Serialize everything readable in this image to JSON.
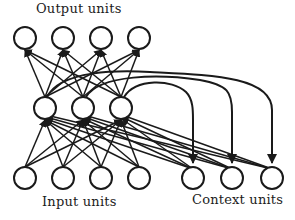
{
  "diagram": {
    "type": "neural-network",
    "canvas": {
      "width": 295,
      "height": 220
    },
    "style": {
      "background": "#ffffff",
      "stroke": "#1a1a1a",
      "node_fill": "#ffffff",
      "node_radius": 11,
      "node_stroke_width": 2,
      "connection_stroke_width": 1.5,
      "recurrent_stroke_width": 2
    },
    "labels": {
      "output": "Output units",
      "input": "Input units",
      "context": "Context units"
    },
    "layers": [
      {
        "name": "output",
        "label": "Output units",
        "count": 4,
        "y": 38,
        "nodes": [
          {
            "id": "o1",
            "x": 25,
            "y": 38
          },
          {
            "id": "o2",
            "x": 63,
            "y": 38
          },
          {
            "id": "o3",
            "x": 101,
            "y": 38
          },
          {
            "id": "o4",
            "x": 139,
            "y": 38
          }
        ]
      },
      {
        "name": "hidden",
        "label": "Hidden units",
        "count": 3,
        "y": 108,
        "nodes": [
          {
            "id": "h1",
            "x": 45,
            "y": 108
          },
          {
            "id": "h2",
            "x": 83,
            "y": 108
          },
          {
            "id": "h3",
            "x": 121,
            "y": 108
          }
        ]
      },
      {
        "name": "input",
        "label": "Input units",
        "count": 4,
        "y": 178,
        "nodes": [
          {
            "id": "i1",
            "x": 25,
            "y": 178
          },
          {
            "id": "i2",
            "x": 63,
            "y": 178
          },
          {
            "id": "i3",
            "x": 101,
            "y": 178
          },
          {
            "id": "i4",
            "x": 139,
            "y": 178
          }
        ]
      },
      {
        "name": "context",
        "label": "Context units",
        "count": 3,
        "y": 178,
        "nodes": [
          {
            "id": "c1",
            "x": 193,
            "y": 178
          },
          {
            "id": "c2",
            "x": 232,
            "y": 178
          },
          {
            "id": "c3",
            "x": 272,
            "y": 178
          }
        ]
      }
    ],
    "connection_groups": [
      {
        "name": "hidden-to-output",
        "from_layer": "hidden",
        "to_layer": "output",
        "arrow": true,
        "direction": "up",
        "fully_connected": true
      },
      {
        "name": "input-to-hidden",
        "from_layer": "input",
        "to_layer": "hidden",
        "arrow": true,
        "direction": "up",
        "fully_connected": true
      },
      {
        "name": "context-to-hidden",
        "from_layer": "context",
        "to_layer": "hidden",
        "arrow": true,
        "direction": "up-left",
        "fully_connected": true
      },
      {
        "name": "hidden-to-context-recurrent",
        "from_layer": "hidden",
        "to_layer": "context",
        "arrow": true,
        "direction": "down",
        "curved": true,
        "one_to_one": true,
        "pairs": [
          {
            "from": "h1",
            "to": "c3"
          },
          {
            "from": "h2",
            "to": "c2"
          },
          {
            "from": "h3",
            "to": "c1"
          }
        ]
      }
    ]
  }
}
